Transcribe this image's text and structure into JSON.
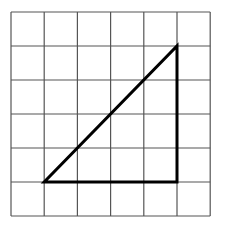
{
  "diagram": {
    "type": "grid-with-triangle",
    "grid": {
      "columns": 6,
      "rows": 6,
      "origin_px": [
        11,
        12
      ],
      "cell_w": 33.2,
      "cell_h": 34,
      "line_color": "#555555"
    },
    "triangle": {
      "vertices_grid": [
        [
          1,
          5
        ],
        [
          5,
          5
        ],
        [
          5,
          1
        ]
      ],
      "stroke_color": "#000000",
      "stroke_width": 3,
      "legs": {
        "horizontal": 4,
        "vertical": 4
      }
    }
  }
}
